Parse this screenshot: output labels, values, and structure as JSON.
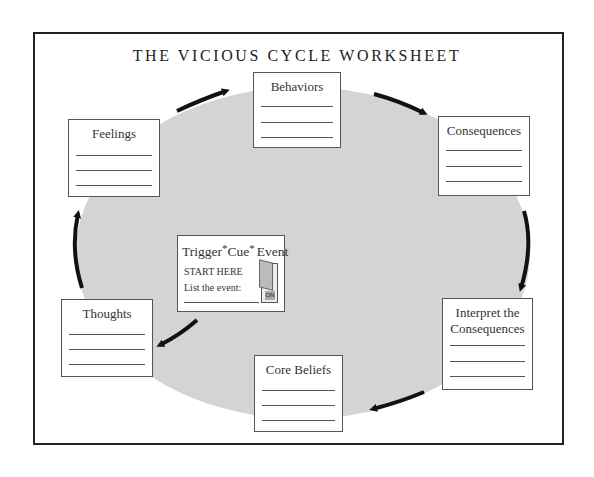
{
  "title": "THE VICIOUS CYCLE WORKSHEET",
  "colors": {
    "ellipse": "#d4d4d4",
    "arrow": "#111111",
    "border": "#222222"
  },
  "trigger": {
    "title_parts": [
      "Trigger",
      "*",
      "Cue",
      "*",
      "Event"
    ],
    "start": "START HERE",
    "list": "List the event:",
    "switch_label": "ON"
  },
  "boxes": {
    "behaviors": {
      "label": "Behaviors",
      "lines": 3
    },
    "consequences": {
      "label": "Consequences",
      "lines": 3
    },
    "interpret": {
      "label_line1": "Interpret the",
      "label_line2": "Consequences",
      "lines": 3
    },
    "core_beliefs": {
      "label": "Core Beliefs",
      "lines": 3
    },
    "thoughts": {
      "label": "Thoughts",
      "lines": 3
    },
    "feelings": {
      "label": "Feelings",
      "lines": 3
    }
  },
  "cycle_order": [
    "Trigger*Cue*Event",
    "Thoughts",
    "Feelings",
    "Behaviors",
    "Consequences",
    "Interpret the Consequences",
    "Core Beliefs"
  ]
}
